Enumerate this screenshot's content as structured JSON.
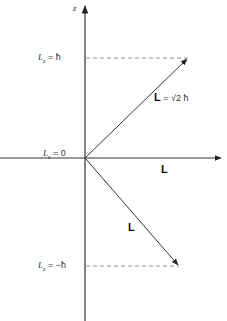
{
  "diagram": {
    "axis": {
      "label": "z"
    },
    "levels": [
      {
        "label": "L_z = ħ",
        "display": "L",
        "sub": "z",
        "value": "= ħ",
        "y": 58
      },
      {
        "label": "L_z = 0",
        "display": "L",
        "sub": "z",
        "value": "= 0",
        "y": 158
      },
      {
        "label": "L_z = −ħ",
        "display": "L",
        "sub": "z",
        "value": "= −ħ",
        "y": 266
      }
    ],
    "vectors": [
      {
        "name": "L-up",
        "label": "L",
        "magnitude": "= √2 ħ",
        "from": [
          85,
          158
        ],
        "to": [
          188,
          58
        ]
      },
      {
        "name": "L-horizontal",
        "label": "L",
        "from": [
          85,
          158
        ],
        "to": [
          222,
          158
        ]
      },
      {
        "name": "L-down",
        "label": "L",
        "from": [
          85,
          158
        ],
        "to": [
          179,
          266
        ]
      }
    ],
    "colors": {
      "line": "#333333",
      "dashed": "#777777",
      "background": "#ffffff"
    }
  }
}
